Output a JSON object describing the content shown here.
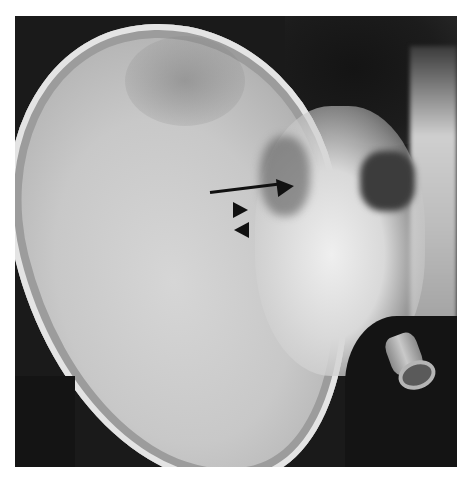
{
  "figure": {
    "type": "radiograph",
    "annotations": [
      {
        "kind": "arrow",
        "direction": "right",
        "label": ""
      },
      {
        "kind": "arrowhead",
        "direction": "right",
        "label": ""
      },
      {
        "kind": "arrowhead",
        "direction": "left",
        "label": ""
      }
    ]
  },
  "caption": {
    "text": ""
  },
  "colors": {
    "background": "#ffffff",
    "film_dark": "#1a1a1a",
    "bone_light": "#d6d6d6",
    "annotation": "#111111"
  }
}
